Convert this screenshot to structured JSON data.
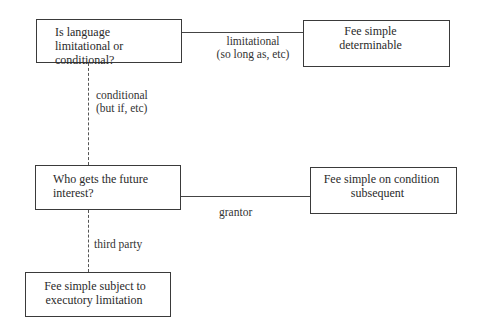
{
  "diagram": {
    "title": "",
    "nodes": [
      {
        "id": "q1",
        "lines": [
          "Is language",
          "limitational or conditional?"
        ]
      },
      {
        "id": "fsd",
        "lines": [
          "Fee simple",
          "determinable"
        ]
      },
      {
        "id": "q2",
        "lines": [
          "Who gets the future",
          "interest?"
        ]
      },
      {
        "id": "fscs",
        "lines": [
          "Fee simple on condition",
          "subsequent"
        ]
      },
      {
        "id": "fssel",
        "lines": [
          "Fee simple subject to",
          "executory limitation"
        ]
      }
    ],
    "edges": [
      {
        "from": "q1",
        "to": "fsd",
        "style": "solid",
        "lines": [
          "limitational",
          "(so long as, etc)"
        ]
      },
      {
        "from": "q1",
        "to": "q2",
        "style": "dashed",
        "lines": [
          "conditional",
          "(but if, etc)"
        ]
      },
      {
        "from": "q2",
        "to": "fscs",
        "style": "solid",
        "lines": [
          "grantor"
        ]
      },
      {
        "from": "q2",
        "to": "fssel",
        "style": "dashed",
        "lines": [
          "third party"
        ]
      }
    ]
  }
}
